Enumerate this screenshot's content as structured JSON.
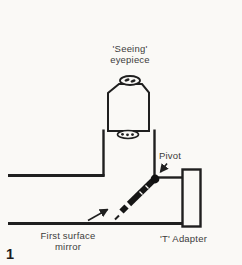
{
  "figure": {
    "number": "1",
    "kind": "line-diagram"
  },
  "colors": {
    "background": "#faf9f6",
    "ink": "#1f1f1f",
    "mirror_fill": "#161616",
    "text": "#3c3c3c"
  },
  "labels": {
    "eyepiece": {
      "line1": "'Seeing'",
      "line2": "eyepiece"
    },
    "pivot": "Pivot",
    "first_surface_mirror": {
      "line1": "First surface",
      "line2": "mirror"
    },
    "t_adapter": "'T' Adapter"
  }
}
